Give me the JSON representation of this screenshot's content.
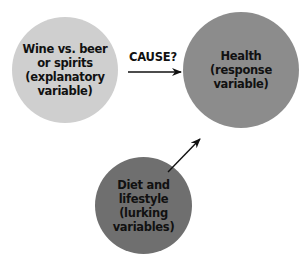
{
  "diagram": {
    "nodes": [
      {
        "id": "explanatory",
        "label": "Wine vs. beer\nor spirits\n(explanatory\nvariable)",
        "color": "#cfcfcf"
      },
      {
        "id": "response",
        "label": "Health\n(response\nvariable)",
        "color": "#8c8c8c"
      },
      {
        "id": "lurking",
        "label": "Diet and\nlifestyle\n(lurking\nvariables)",
        "color": "#6f6f6f"
      }
    ],
    "edges": [
      {
        "from": "explanatory",
        "to": "response",
        "label": "CAUSE?"
      },
      {
        "from": "lurking",
        "to": "response",
        "label": ""
      }
    ]
  }
}
